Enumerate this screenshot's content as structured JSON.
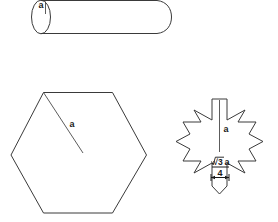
{
  "figure": {
    "background_color": "#ffffff",
    "stroke_color": "#3a3a3a",
    "label_color": "#1a1a1a"
  },
  "cylinder": {
    "name": "cylinder",
    "radius_label": "a",
    "description": "Horizontal cylinder drawn with elliptical left cap and rounded right end, radius marked a"
  },
  "hexagon": {
    "name": "regular-hexagon",
    "radius_label": "a",
    "description": "Regular hexagon with flat top and bottom edges, radius segment from top-left vertex to center labelled a"
  },
  "star": {
    "name": "six-pointed-star",
    "radius_label": "a",
    "dimension": {
      "radical": "√3",
      "numerator_variable": "a",
      "denominator": "4",
      "full_text": "√3a/4"
    },
    "description": "Six-pointed star (asterisk shape) with vertical radius a and arm width dimension root three a over four"
  }
}
